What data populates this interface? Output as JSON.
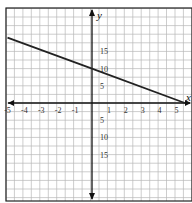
{
  "chart_data": {
    "type": "line",
    "title": "",
    "xlabel": "x",
    "ylabel": "y",
    "xlim": [
      -5,
      5.5
    ],
    "ylim": [
      -20,
      20
    ],
    "grid": true,
    "x_ticks": [
      "-5",
      "-4",
      "-3",
      "-2",
      "-1",
      "1",
      "2",
      "3",
      "4",
      "5"
    ],
    "y_ticks_positive": [
      "5",
      "10",
      "15"
    ],
    "y_ticks_negative_labels": [
      "5",
      "10",
      "15"
    ],
    "series": [
      {
        "name": "line",
        "x": [
          -5,
          0,
          5.5
        ],
        "y": [
          19,
          10,
          0
        ],
        "color": "#222222"
      }
    ],
    "colors": {
      "grid": "#b8b8b8",
      "axis": "#111111",
      "frame": "#222222",
      "line": "#222222"
    }
  }
}
